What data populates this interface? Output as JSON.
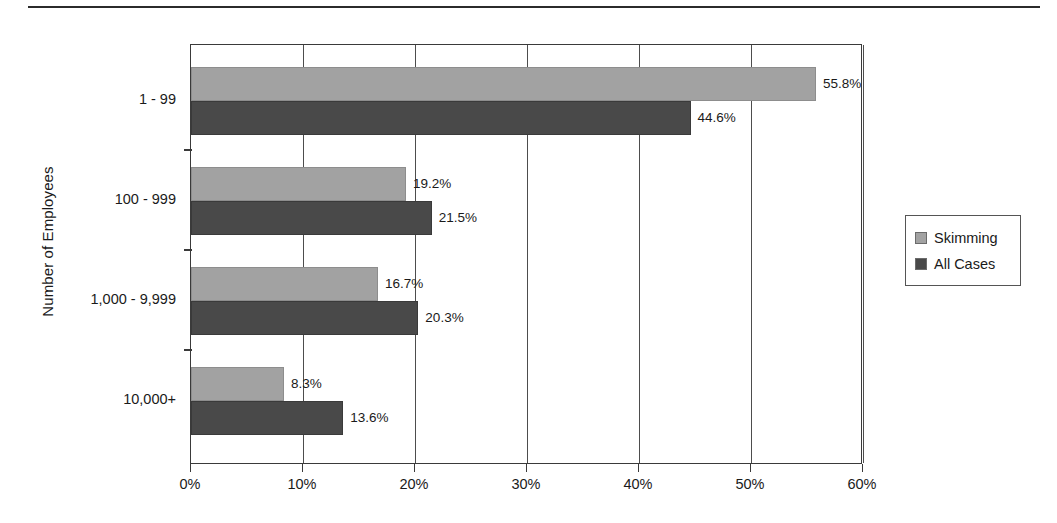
{
  "chart_data": {
    "type": "bar",
    "orientation": "horizontal",
    "title": "",
    "xlabel": "",
    "ylabel": "Number of Employees",
    "categories": [
      "1 - 99",
      "100 - 999",
      "1,000 - 9,999",
      "10,000+"
    ],
    "series": [
      {
        "name": "Skimming",
        "color": "#a2a2a2",
        "values": [
          55.8,
          19.2,
          16.7,
          8.3
        ],
        "labels": [
          "55.8%",
          "19.2%",
          "16.7%",
          "8.3%"
        ]
      },
      {
        "name": "All Cases",
        "color": "#494949",
        "values": [
          44.6,
          21.5,
          20.3,
          13.6
        ],
        "labels": [
          "44.6%",
          "21.5%",
          "20.3%",
          "13.6%"
        ]
      }
    ],
    "xlim": [
      0,
      60
    ],
    "xticks": [
      0,
      10,
      20,
      30,
      40,
      50,
      60
    ],
    "xtick_labels": [
      "0%",
      "10%",
      "20%",
      "30%",
      "40%",
      "50%",
      "60%"
    ],
    "grid": "vertical",
    "legend_position": "right"
  },
  "legend": {
    "entries": [
      {
        "label": "Skimming"
      },
      {
        "label": "All Cases"
      }
    ]
  }
}
